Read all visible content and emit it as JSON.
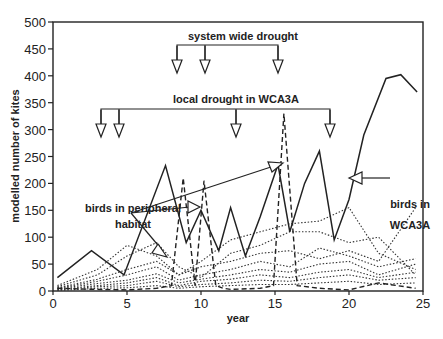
{
  "chart_data": {
    "type": "line",
    "title": "",
    "xlabel": "year",
    "ylabel": "modelled number of kites",
    "xlim": [
      0,
      25
    ],
    "ylim": [
      0,
      500
    ],
    "x_ticks": [
      0,
      5,
      10,
      15,
      20,
      25
    ],
    "y_ticks": [
      0,
      50,
      100,
      150,
      200,
      250,
      300,
      350,
      400,
      450,
      500
    ],
    "grid": false,
    "legend": "none (inline annotations)",
    "series": [
      {
        "name": "birds in WCA3A",
        "style": "solid",
        "x": [
          0.3,
          2.6,
          4.8,
          7.6,
          9.0,
          10.0,
          11.2,
          12.0,
          13.0,
          14.0,
          15.2,
          16.0,
          17.0,
          18.0,
          19.0,
          20.0,
          21.0,
          22.5,
          23.5,
          24.6
        ],
        "y": [
          25,
          75,
          30,
          233,
          90,
          150,
          75,
          155,
          65,
          138,
          235,
          110,
          200,
          260,
          95,
          170,
          290,
          395,
          402,
          370
        ]
      },
      {
        "name": "birds in peripheral habitat (dashed, spiking)",
        "style": "dashed",
        "x": [
          0.3,
          3,
          5,
          7,
          8,
          8.8,
          9.6,
          10.2,
          11,
          11.5,
          12,
          14,
          14.9,
          15.6,
          16.5,
          18,
          20,
          22,
          24.5
        ],
        "y": [
          5,
          3,
          2,
          5,
          10,
          210,
          10,
          205,
          10,
          5,
          3,
          5,
          10,
          330,
          10,
          5,
          2,
          15,
          5
        ]
      },
      {
        "name": "birds in peripheral habitat (dotted, multiple sites)",
        "style": "dotted",
        "note": "approximately 15 low-level dotted series between 0 and ~165; representative traces",
        "traces": [
          {
            "x": [
              0.3,
              3,
              5,
              7,
              8.5,
              10,
              12,
              14,
              16,
              18,
              20,
              22,
              24.5
            ],
            "y": [
              10,
              40,
              85,
              65,
              30,
              55,
              95,
              110,
              125,
              130,
              155,
              70,
              40
            ]
          },
          {
            "x": [
              0.3,
              3,
              5,
              7,
              8.5,
              10,
              12,
              14,
              16,
              18,
              20,
              22,
              24.5
            ],
            "y": [
              8,
              30,
              65,
              90,
              45,
              25,
              70,
              85,
              110,
              110,
              90,
              100,
              30
            ]
          },
          {
            "x": [
              0.3,
              3,
              5,
              7,
              8.5,
              10,
              12,
              14,
              16,
              18,
              20,
              22,
              24.5
            ],
            "y": [
              6,
              22,
              40,
              55,
              30,
              45,
              55,
              70,
              75,
              60,
              75,
              55,
              155
            ]
          },
          {
            "x": [
              0.3,
              3,
              5,
              7,
              8.5,
              10,
              12,
              14,
              16,
              18,
              20,
              22,
              24.5
            ],
            "y": [
              5,
              18,
              30,
              45,
              20,
              30,
              40,
              55,
              45,
              80,
              65,
              45,
              60
            ]
          },
          {
            "x": [
              0.3,
              3,
              5,
              7,
              8.5,
              10,
              12,
              14,
              16,
              18,
              20,
              22,
              24.5
            ],
            "y": [
              4,
              14,
              20,
              32,
              15,
              22,
              30,
              40,
              35,
              50,
              55,
              30,
              50
            ]
          },
          {
            "x": [
              0.3,
              3,
              5,
              7,
              8.5,
              10,
              12,
              14,
              16,
              18,
              20,
              22,
              24.5
            ],
            "y": [
              3,
              10,
              15,
              25,
              10,
              18,
              22,
              30,
              25,
              35,
              40,
              25,
              35
            ]
          },
          {
            "x": [
              0.3,
              3,
              5,
              7,
              8.5,
              10,
              12,
              14,
              16,
              18,
              20,
              22,
              24.5
            ],
            "y": [
              2,
              8,
              10,
              18,
              8,
              12,
              15,
              20,
              18,
              25,
              30,
              20,
              25
            ]
          },
          {
            "x": [
              0.3,
              3,
              5,
              7,
              8.5,
              10,
              12,
              14,
              16,
              18,
              20,
              22,
              24.5
            ],
            "y": [
              1,
              5,
              6,
              10,
              5,
              8,
              10,
              12,
              12,
              15,
              18,
              12,
              15
            ]
          }
        ]
      }
    ],
    "annotations": [
      {
        "text": "system wide drought",
        "arrows_at_year": [
          8.5,
          10.3,
          15.2
        ]
      },
      {
        "text": "local drought in WCA3A",
        "arrows_at_year": [
          3.2,
          4.4,
          12.3,
          18.7
        ]
      },
      {
        "text": "birds in peripheral habitat",
        "arrows_to": [
          [
            7.7,
            170
          ],
          [
            10.3,
            193
          ],
          [
            15.1,
            285
          ]
        ]
      },
      {
        "text": "birds in WCA3A",
        "arrow_to": [
          19.8,
          170
        ]
      }
    ]
  },
  "labels": {
    "xlabel": "year",
    "ylabel": "modelled number of kites",
    "system_drought": "system wide drought",
    "local_drought": "local drought in WCA3A",
    "peripheral_line1": "birds in peripheral",
    "peripheral_line2": "habitat",
    "wca3a_line1": "birds in",
    "wca3a_line2": "WCA3A"
  }
}
